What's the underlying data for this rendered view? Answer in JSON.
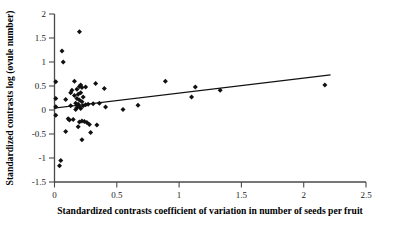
{
  "chart_data": {
    "type": "scatter",
    "title": "",
    "subtitle": "",
    "xlabel": "Standardized contrasts coefficient of variation in number of seeds per fruit",
    "ylabel": "Standardized contrasts log (ovule number)",
    "xlim": [
      0,
      2.5
    ],
    "ylim": [
      -1.5,
      2
    ],
    "xticks": [
      0,
      0.5,
      1,
      1.5,
      2,
      2.5
    ],
    "xtick_labels": [
      "0",
      "0.5",
      "1",
      "1.5",
      "2",
      "2.5"
    ],
    "yticks": [
      -1.5,
      -1,
      -0.5,
      0,
      0.5,
      1,
      1.5,
      2
    ],
    "ytick_labels": [
      "-1.5",
      "-1",
      "-0.5",
      "0",
      "0.5",
      "1",
      "1.5",
      "2"
    ],
    "grid": false,
    "legend": false,
    "legend_position": "none",
    "marker": "diamond",
    "marker_color": "#111111",
    "series": [
      {
        "name": "standardized contrasts",
        "points": [
          [
            0.01,
            0.59
          ],
          [
            0.01,
            0.24
          ],
          [
            0.01,
            0.07
          ],
          [
            0.01,
            -0.11
          ],
          [
            0.06,
            1.23
          ],
          [
            0.07,
            1.0
          ],
          [
            0.09,
            0.22
          ],
          [
            0.09,
            -0.45
          ],
          [
            0.04,
            -1.16
          ],
          [
            0.05,
            -1.05
          ],
          [
            0.11,
            -0.18
          ],
          [
            0.12,
            -0.21
          ],
          [
            0.13,
            0.36
          ],
          [
            0.13,
            0.09
          ],
          [
            0.14,
            0.41
          ],
          [
            0.15,
            -0.2
          ],
          [
            0.16,
            0.6
          ],
          [
            0.16,
            0.3
          ],
          [
            0.17,
            0.14
          ],
          [
            0.17,
            0.01
          ],
          [
            0.18,
            0.43
          ],
          [
            0.18,
            0.24
          ],
          [
            0.18,
            0.05
          ],
          [
            0.19,
            0.33
          ],
          [
            0.19,
            0.12
          ],
          [
            0.19,
            -0.35
          ],
          [
            0.2,
            1.63
          ],
          [
            0.2,
            0.49
          ],
          [
            0.2,
            0.21
          ],
          [
            0.2,
            0.07
          ],
          [
            0.2,
            -0.25
          ],
          [
            0.21,
            0.52
          ],
          [
            0.21,
            0.36
          ],
          [
            0.21,
            0.03
          ],
          [
            0.22,
            0.47
          ],
          [
            0.22,
            0.17
          ],
          [
            0.22,
            -0.23
          ],
          [
            0.22,
            -0.62
          ],
          [
            0.23,
            0.27
          ],
          [
            0.23,
            0.09
          ],
          [
            0.24,
            -0.24
          ],
          [
            0.25,
            0.48
          ],
          [
            0.25,
            0.11
          ],
          [
            0.26,
            -0.26
          ],
          [
            0.27,
            0.12
          ],
          [
            0.28,
            -0.3
          ],
          [
            0.29,
            -0.47
          ],
          [
            0.31,
            0.13
          ],
          [
            0.33,
            0.55
          ],
          [
            0.34,
            -0.31
          ],
          [
            0.36,
            0.14
          ],
          [
            0.4,
            0.45
          ],
          [
            0.41,
            0.06
          ],
          [
            0.55,
            0.01
          ],
          [
            0.67,
            0.1
          ],
          [
            0.89,
            0.6
          ],
          [
            1.1,
            0.27
          ],
          [
            1.13,
            0.48
          ],
          [
            1.33,
            0.41
          ],
          [
            2.17,
            0.52
          ]
        ]
      }
    ],
    "trend_line": {
      "name": "least-squares regression line",
      "x_start": 0.0,
      "y_start": 0.04,
      "x_end": 2.21,
      "y_end": 0.73,
      "slope": 0.31,
      "intercept": 0.04
    }
  }
}
